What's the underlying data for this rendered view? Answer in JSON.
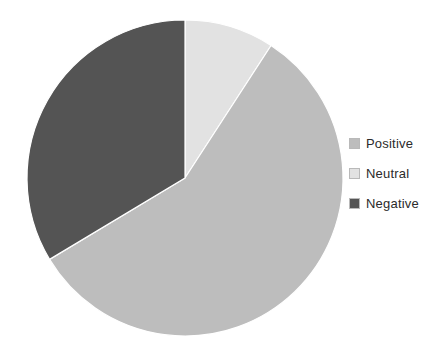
{
  "chart_data": {
    "type": "pie",
    "title": "",
    "categories": [
      "Positive",
      "Neutral",
      "Negative"
    ],
    "values": [
      57,
      9,
      34
    ],
    "units": "percent",
    "colors": [
      "#bdbdbd",
      "#e2e2e2",
      "#545454"
    ],
    "legend_position": "right",
    "start_angle_deg": 0,
    "direction": "clockwise",
    "slice_border_color": "#ffffff",
    "grid": false,
    "xlabel": "",
    "ylabel": "",
    "slices": [
      {
        "label": "Neutral",
        "value": 9,
        "color": "#e2e2e2",
        "start_deg": 0,
        "end_deg": 33
      },
      {
        "label": "Positive",
        "value": 57,
        "color": "#bdbdbd",
        "start_deg": 33,
        "end_deg": 239
      },
      {
        "label": "Negative",
        "value": 34,
        "color": "#545454",
        "start_deg": 239,
        "end_deg": 360
      }
    ]
  },
  "legend": {
    "items": [
      {
        "label": "Positive",
        "color": "#bdbdbd",
        "swatch_name": "legend-swatch-positive"
      },
      {
        "label": "Neutral",
        "color": "#e2e2e2",
        "swatch_name": "legend-swatch-neutral"
      },
      {
        "label": "Negative",
        "color": "#545454",
        "swatch_name": "legend-swatch-negative"
      }
    ]
  },
  "geometry": {
    "center_x": 185,
    "center_y": 178,
    "radius": 158
  },
  "background_color": "#ffffff"
}
